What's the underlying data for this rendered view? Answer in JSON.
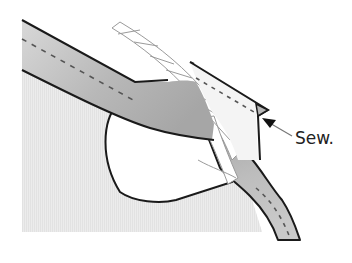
{
  "diagram": {
    "type": "sewing-instruction-illustration",
    "annotation": {
      "label": "Sew.",
      "arrow_direction": "pointing-up-left"
    },
    "parts": [
      {
        "name": "fabric-body",
        "description": "textured light-gray garment fabric"
      },
      {
        "name": "armhole-opening",
        "description": "white curved opening"
      },
      {
        "name": "bias-strip",
        "description": "gray bias strip with dashed stitch line, running from upper-left and curving down to lower-right"
      },
      {
        "name": "twisted-cord",
        "description": "white twisted cord laid diagonally across the strip"
      },
      {
        "name": "folded-flap",
        "description": "white folded end flap with dashed stitch line"
      }
    ],
    "colors": {
      "fabric": "#ececec",
      "strip_dark": "#a9a9a9",
      "strip_light": "#d9d9d9",
      "outline": "#1a1a1a",
      "stitch": "#555555",
      "flap": "#f4f4f4"
    }
  }
}
